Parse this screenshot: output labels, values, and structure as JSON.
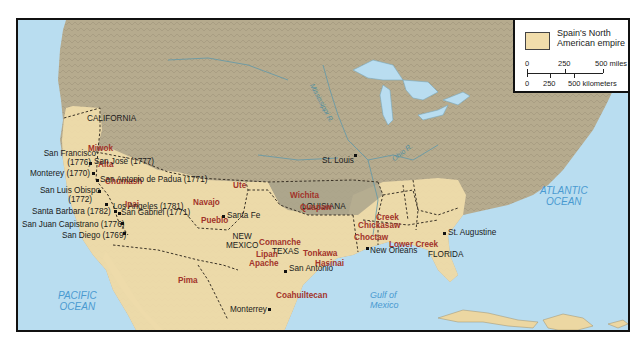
{
  "legend": {
    "swatch_label_line1": "Spain's North",
    "swatch_label_line2": "American empire",
    "swatch_color": "#f1ddab",
    "miles_ticks": [
      "0",
      "250",
      "500 miles"
    ],
    "km_ticks": [
      "0",
      "250",
      "500 kilometers"
    ]
  },
  "colors": {
    "ocean": "#b9ddf0",
    "land": "#b6ab8e",
    "empire": "#f1ddab",
    "border": "#3a3226",
    "tribe_text": "#a2332a",
    "water_text": "#4a9ad0"
  },
  "oceans": {
    "pacific_line1": "PACIFIC",
    "pacific_line2": "OCEAN",
    "atlantic_line1": "ATLANTIC",
    "atlantic_line2": "OCEAN",
    "gulf_line1": "Gulf of",
    "gulf_line2": "Mexico"
  },
  "rivers": {
    "mississippi": "Mississippi R.",
    "ohio": "Ohio R."
  },
  "regions": {
    "california": "CALIFORNIA",
    "new_mexico_line1": "NEW",
    "new_mexico_line2": "MEXICO",
    "texas": "TEXAS",
    "louisiana": "LOUISIANA",
    "florida": "FLORIDA"
  },
  "tribes": {
    "miwok": "Miwok",
    "alta": "Alta",
    "chumash": "Chumash",
    "ipai": "Ipai",
    "pima": "Pima",
    "ute": "Ute",
    "navajo": "Navajo",
    "pueblo": "Pueblo",
    "comanche": "Comanche",
    "lipan_line1": "Lipan",
    "lipan_line2": "Apache",
    "tonkawa": "Tonkawa",
    "hasinai": "Hasinai",
    "wichita": "Wichita",
    "quapaw": "Quapaw",
    "creek": "Creek",
    "chickasaw": "Chickasaw",
    "choctaw": "Choctaw",
    "lower_creek": "Lower Creek",
    "coahuiltecan": "Coahuiltecan"
  },
  "places": {
    "san_francisco_line1": "San Francisco",
    "san_francisco_line2": "(1776)",
    "san_jose": "San José (1777)",
    "monterey_ca": "Monterey (1770)",
    "san_antonio_padua": "San Antonio de Padua (1771)",
    "san_luis_obispo_line1": "San Luis Obispo",
    "san_luis_obispo_line2": "(1772)",
    "santa_barbara": "Santa Barbara (1782)",
    "los_angeles": "Los Angeles (1781)",
    "san_gabriel": "San Gabriel (1771)",
    "san_juan_capistrano": "San Juan Capistrano (1776)",
    "san_diego": "San Diego (1769)",
    "santa_fe": "Santa Fe",
    "san_antonio": "San Antonio",
    "monterrey": "Monterrey",
    "new_orleans": "New Orleans",
    "st_louis": "St. Louis",
    "st_augustine": "St. Augustine"
  }
}
